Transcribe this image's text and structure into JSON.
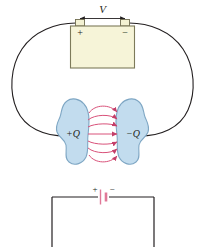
{
  "figure": {
    "background_color": "#ffffff"
  },
  "colors": {
    "wire": "#231f20",
    "battery_body_fill": "#f6f4d8",
    "battery_body_stroke": "#7d7a5a",
    "terminal_fill": "#f3f1d2",
    "terminal_stroke": "#6f6c50",
    "conductor_fill": "#c2dcee",
    "conductor_stroke": "#7fa7c4",
    "field_line": "#d9527a",
    "field_line_dark": "#c43f69",
    "label_text": "#231f20",
    "circuit_line": "#231f20",
    "battery_symbol": "#e07898"
  },
  "top_panel": {
    "voltage_label": "V",
    "voltage_arrow": "double-headed",
    "battery": {
      "plus_sign": "+",
      "minus_sign": "−",
      "terminal_count": 2
    }
  },
  "field_panel": {
    "left_conductor_label": "+Q",
    "right_conductor_label": "−Q",
    "field_line_count": 7,
    "field_direction": "left-to-right"
  },
  "bottom_panel": {
    "battery_symbol_plus": "+",
    "battery_symbol_minus": "−",
    "shape": "rectangle-circuit"
  }
}
